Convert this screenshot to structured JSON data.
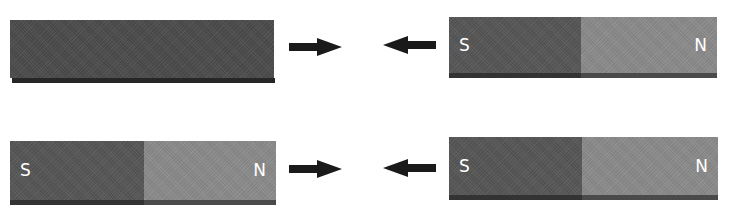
{
  "diagram": {
    "title": "",
    "rows": [
      {
        "left_object": {
          "type": "unmagnetized-bar",
          "color": "#4a4a4a",
          "edge_color": "#2a2a2a"
        },
        "left_arrow": {
          "direction": "right"
        },
        "right_arrow": {
          "direction": "left"
        },
        "right_object": {
          "type": "bar-magnet",
          "poles": [
            {
              "label": "S",
              "color": "#555555"
            },
            {
              "label": "N",
              "color": "#8a8a8a"
            }
          ],
          "edge_color": "#3a3a3a"
        }
      },
      {
        "left_object": {
          "type": "bar-magnet",
          "poles": [
            {
              "label": "S",
              "color": "#555555"
            },
            {
              "label": "N",
              "color": "#8a8a8a"
            }
          ],
          "edge_color": "#3a3a3a"
        },
        "left_arrow": {
          "direction": "right"
        },
        "right_arrow": {
          "direction": "left"
        },
        "right_object": {
          "type": "bar-magnet",
          "poles": [
            {
              "label": "S",
              "color": "#555555"
            },
            {
              "label": "N",
              "color": "#8a8a8a"
            }
          ],
          "edge_color": "#3a3a3a"
        }
      }
    ],
    "arrow_color": "#1a1a1a"
  }
}
